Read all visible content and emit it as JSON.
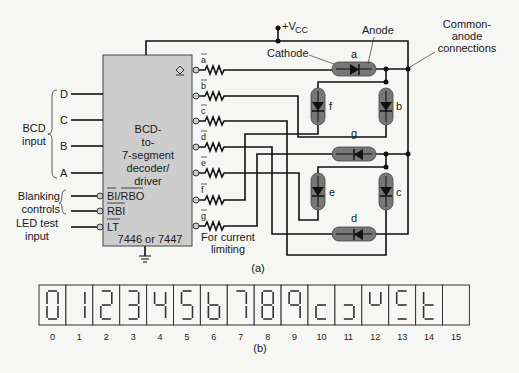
{
  "figure": {
    "part_a_label": "(a)",
    "part_b_label": "(b)"
  },
  "decoder": {
    "title_lines": [
      "BCD-",
      "to-",
      "7-segment",
      "decoder/",
      "driver"
    ],
    "part_number": "7446 or 7447",
    "inputs": [
      "D",
      "C",
      "B",
      "A"
    ],
    "control_pins": [
      "BI/RBO",
      "RBI",
      "LT"
    ],
    "outputs": [
      "a",
      "b",
      "c",
      "d",
      "e",
      "f",
      "g"
    ],
    "fill_color": "#cdcdcd"
  },
  "labels": {
    "bcd_input": [
      "BCD",
      "input"
    ],
    "blanking_controls": [
      "Blanking",
      "controls"
    ],
    "led_test_input": [
      "LED test",
      "input"
    ],
    "current_limiting": [
      "For current",
      "limiting"
    ],
    "vcc": "+V",
    "vcc_sub": "CC",
    "cathode": "Cathode",
    "anode": "Anode",
    "common_anode": [
      "Common-",
      "anode",
      "connections"
    ]
  },
  "segments": {
    "names": [
      "a",
      "b",
      "c",
      "d",
      "e",
      "f",
      "g"
    ],
    "led_color": "#777777"
  },
  "digits": {
    "codes": [
      "0",
      "1",
      "2",
      "3",
      "4",
      "5",
      "6",
      "7",
      "8",
      "9",
      "10",
      "11",
      "12",
      "13",
      "14",
      "15"
    ],
    "patterns": [
      "abcdef",
      "bc",
      "abdeg",
      "abcdg",
      "bcfg",
      "acdfg",
      "cdefg",
      "abc",
      "abcdefg",
      "abcfg",
      "deg",
      "cdg",
      "bfg",
      "adfg",
      "defg",
      ""
    ]
  }
}
